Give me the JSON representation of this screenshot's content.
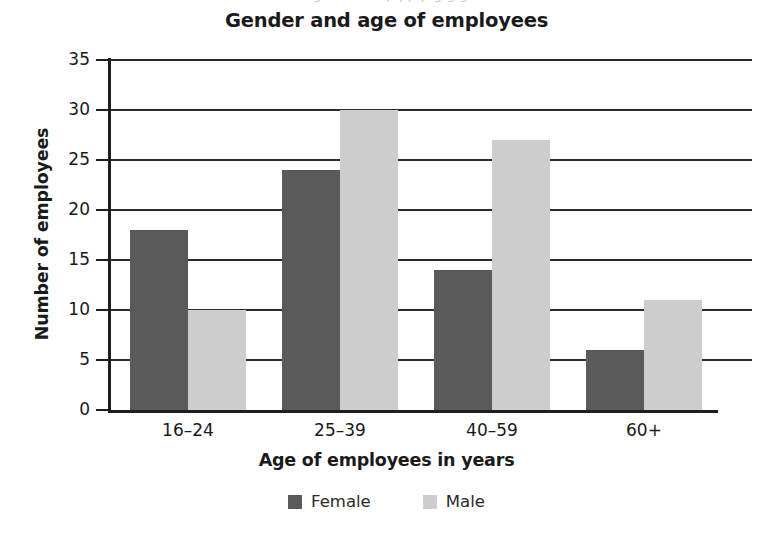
{
  "top_artifact": "ng nnn nnn p pp p g g g",
  "chart_data": {
    "type": "bar",
    "title": "Gender and age of employees",
    "xlabel": "Age of employees in years",
    "ylabel": "Number of employees",
    "categories": [
      "16–24",
      "25–39",
      "40–59",
      "60+"
    ],
    "series": [
      {
        "name": "Female",
        "values": [
          18,
          24,
          14,
          6
        ],
        "color": "#5a5a5a"
      },
      {
        "name": "Male",
        "values": [
          10,
          30,
          27,
          11
        ],
        "color": "#cdcdcd"
      }
    ],
    "ylim": [
      0,
      35
    ],
    "ytick_step": 5,
    "yticks": [
      0,
      5,
      10,
      15,
      20,
      25,
      30,
      35
    ],
    "ytick_labels": [
      "0",
      "5",
      "10",
      "15",
      "20",
      "25",
      "30",
      "35"
    ],
    "grid": true,
    "grid_axis": "y",
    "legend_position": "bottom"
  }
}
